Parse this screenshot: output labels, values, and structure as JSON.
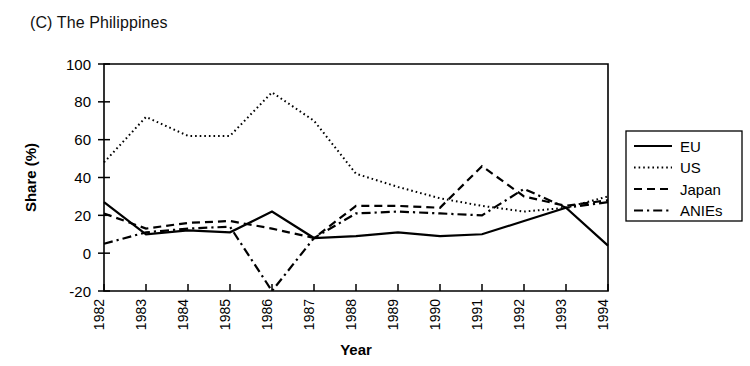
{
  "figure": {
    "panel_title": "(C) The Philippines"
  },
  "chart_data": {
    "type": "line",
    "title": "(C) The Philippines",
    "xlabel": "Year",
    "ylabel": "Share (%)",
    "categories": [
      "1982",
      "1983",
      "1984",
      "1985",
      "1986",
      "1987",
      "1988",
      "1989",
      "1990",
      "1991",
      "1992",
      "1993",
      "1994"
    ],
    "x": [
      1982,
      1983,
      1984,
      1985,
      1986,
      1987,
      1988,
      1989,
      1990,
      1991,
      1992,
      1993,
      1994
    ],
    "xlim": [
      1982,
      1994
    ],
    "ylim": [
      -20,
      100
    ],
    "yticks": [
      -20,
      0,
      20,
      40,
      60,
      80,
      100
    ],
    "ytick_labels": [
      "-20",
      "0",
      "20",
      "40",
      "60",
      "80",
      "100"
    ],
    "grid": false,
    "legend_position": "right-outside",
    "series": [
      {
        "name": "EU",
        "style": "solid",
        "values": [
          27,
          10,
          12,
          11,
          22,
          8,
          9,
          11,
          9,
          10,
          17,
          24,
          4
        ]
      },
      {
        "name": "US",
        "style": "dotted",
        "values": [
          48,
          72,
          62,
          62,
          85,
          70,
          42,
          35,
          29,
          25,
          22,
          24,
          30
        ]
      },
      {
        "name": "Japan",
        "style": "dashed",
        "values": [
          21,
          13,
          16,
          17,
          13,
          8,
          25,
          25,
          24,
          46,
          30,
          25,
          28
        ]
      },
      {
        "name": "ANIEs",
        "style": "dashdot",
        "values": [
          5,
          11,
          13,
          14,
          -20,
          8,
          21,
          22,
          21,
          20,
          34,
          24,
          27
        ]
      }
    ]
  },
  "legend": {
    "items": [
      {
        "label": "EU",
        "style": "solid"
      },
      {
        "label": "US",
        "style": "dotted"
      },
      {
        "label": "Japan",
        "style": "dashed"
      },
      {
        "label": "ANIEs",
        "style": "dashdot"
      }
    ]
  }
}
